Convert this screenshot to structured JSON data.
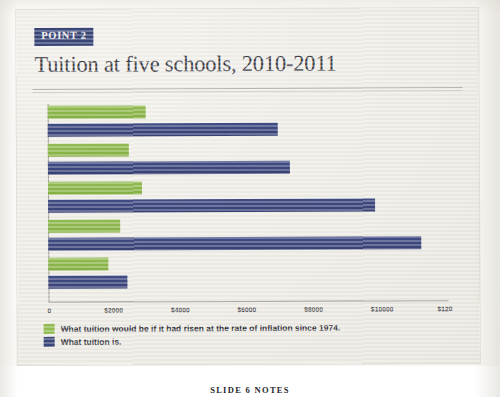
{
  "slide": {
    "badge_label": "POINT 2",
    "title": "Tuition at five schools, 2010-2011",
    "caption": "SLIDE 6 NOTES"
  },
  "colors": {
    "green": "#93bd53",
    "navy": "#3c4879",
    "slide_bg": "#efede7",
    "title_text": "#3b3b44"
  },
  "legend": {
    "items": [
      {
        "swatch": "green",
        "label": "What tuition would be if it had risen at the rate of inflation since 1974."
      },
      {
        "swatch": "navy",
        "label": "What tuition is."
      }
    ]
  },
  "chart_data": {
    "type": "bar",
    "orientation": "horizontal",
    "title": "Tuition at five schools, 2010-2011",
    "xlabel": "",
    "ylabel": "",
    "xlim": [
      0,
      12000
    ],
    "grid": false,
    "legend_position": "below",
    "tick_labels": [
      "0",
      "$2000",
      "$4000",
      "$6000",
      "$8000",
      "$10000",
      "$120"
    ],
    "tick_values": [
      0,
      2000,
      4000,
      6000,
      8000,
      10000,
      12000
    ],
    "categories": [
      "School 1",
      "School 2",
      "School 3",
      "School 4",
      "School 5"
    ],
    "series": [
      {
        "name": "What tuition would be if it had risen at the rate of inflation since 1974.",
        "color": "#93bd53",
        "values": [
          2950,
          2430,
          2820,
          2150,
          1800
        ]
      },
      {
        "name": "What tuition is.",
        "color": "#3c4879",
        "values": [
          6900,
          7250,
          9820,
          11200,
          2360
        ]
      }
    ]
  }
}
